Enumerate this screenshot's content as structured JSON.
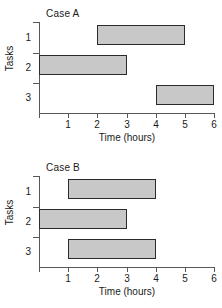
{
  "figure": {
    "bar_fill_color": "#c8c8c8",
    "bar_border_color": "#2b2b2b",
    "axis_color": "#55595c"
  },
  "chart_data": [
    {
      "type": "bar",
      "orientation": "horizontal",
      "title": "Case A",
      "xlabel": "Time (hours)",
      "ylabel": "Tasks",
      "xlim": [
        0,
        6
      ],
      "ylim_categories": [
        "1",
        "2",
        "3"
      ],
      "xticks": [
        "0",
        "1",
        "2",
        "3",
        "4",
        "5",
        "6"
      ],
      "yticks": [
        "1",
        "2",
        "3"
      ],
      "grid": false,
      "legend": "none",
      "categories": [
        "1",
        "2",
        "3"
      ],
      "bars": [
        {
          "task": "1",
          "start": 2,
          "end": 5,
          "duration": 3
        },
        {
          "task": "2",
          "start": 0,
          "end": 3,
          "duration": 3
        },
        {
          "task": "3",
          "start": 4,
          "end": 6,
          "duration": 2
        }
      ]
    },
    {
      "type": "bar",
      "orientation": "horizontal",
      "title": "Case B",
      "xlabel": "Time (hours)",
      "ylabel": "Tasks",
      "xlim": [
        0,
        6
      ],
      "ylim_categories": [
        "1",
        "2",
        "3"
      ],
      "xticks": [
        "0",
        "1",
        "2",
        "3",
        "4",
        "5",
        "6"
      ],
      "yticks": [
        "1",
        "2",
        "3"
      ],
      "grid": false,
      "legend": "none",
      "categories": [
        "1",
        "2",
        "3"
      ],
      "bars": [
        {
          "task": "1",
          "start": 1,
          "end": 4,
          "duration": 3
        },
        {
          "task": "2",
          "start": 0,
          "end": 3,
          "duration": 3
        },
        {
          "task": "3",
          "start": 1,
          "end": 4,
          "duration": 3
        }
      ]
    }
  ]
}
